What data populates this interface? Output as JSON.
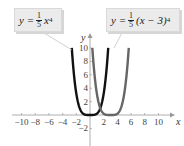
{
  "chart_data": {
    "type": "line",
    "title": "",
    "xlabel": "x",
    "ylabel": "y",
    "xlim": [
      -11,
      11.5
    ],
    "ylim": [
      -3.5,
      11
    ],
    "x_ticks": [
      -10,
      -8,
      -6,
      -4,
      -2,
      2,
      4,
      6,
      8,
      10
    ],
    "x_tick_labels": [
      "−10",
      "−8",
      "−6",
      "−4",
      "−2",
      "2",
      "4",
      "6",
      "8",
      "10"
    ],
    "y_ticks": [
      -2,
      2,
      4,
      6,
      8,
      10
    ],
    "y_tick_labels": [
      "−2",
      "2",
      "4",
      "6",
      "8",
      "10"
    ],
    "grid": false,
    "series": [
      {
        "name": "y = (1/5) x^4",
        "formula": "0.2*x^4",
        "color": "#111111",
        "x": [
          -2.66,
          -2,
          -1.5,
          -1,
          -0.5,
          0,
          0.5,
          1,
          1.5,
          2,
          2.66
        ],
        "values": [
          10,
          3.2,
          1.01,
          0.2,
          0.0125,
          0,
          0.0125,
          0.2,
          1.01,
          3.2,
          10
        ]
      },
      {
        "name": "y = (1/5) (x − 3)^4",
        "formula": "0.2*(x-3)^4",
        "color": "#666666",
        "x": [
          0.34,
          1,
          1.5,
          2,
          2.5,
          3,
          3.5,
          4,
          4.5,
          5,
          5.66
        ],
        "values": [
          10,
          3.2,
          1.01,
          0.2,
          0.0125,
          0,
          0.0125,
          0.2,
          1.01,
          3.2,
          10
        ]
      }
    ],
    "annotations": [
      {
        "text": "y = (1/5) x^4",
        "points_to_series": 0
      },
      {
        "text": "y = (1/5)(x − 3)^4",
        "points_to_series": 1
      }
    ]
  },
  "labels": {
    "left": {
      "lhs": "y =",
      "num": "1",
      "den": "5",
      "var": "x",
      "exp": "4"
    },
    "right": {
      "lhs": "y =",
      "num": "1",
      "den": "5",
      "expr": "(x − 3)",
      "exp": "4"
    }
  }
}
